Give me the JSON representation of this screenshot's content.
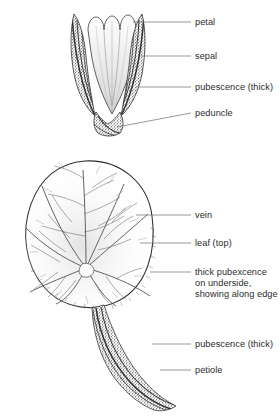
{
  "figure": {
    "background_color": "#ffffff",
    "ink_color": "#231f20",
    "label_color": "#2b2b2b",
    "leader_color": "#6e6e6e"
  },
  "specimens": [
    {
      "name": "flower-bud",
      "parts": [
        "petal",
        "sepal",
        "pubescence",
        "peduncle"
      ]
    },
    {
      "name": "leaf",
      "parts": [
        "vein",
        "blade",
        "pubescence",
        "petiole"
      ]
    }
  ],
  "labels": [
    {
      "id": "petal",
      "text": "petal",
      "x": 195,
      "y": 19
    },
    {
      "id": "sepal",
      "text": "sepal",
      "x": 195,
      "y": 53
    },
    {
      "id": "pubescence-1",
      "text": "pubescence (thick)",
      "x": 195,
      "y": 84
    },
    {
      "id": "peduncle",
      "text": "peduncle",
      "x": 195,
      "y": 110
    },
    {
      "id": "vein",
      "text": "vein",
      "x": 195,
      "y": 212
    },
    {
      "id": "leaf-top",
      "text": "leaf (top)",
      "x": 195,
      "y": 240
    },
    {
      "id": "underside",
      "text": "thick pubexcence\non underside,\nshowing along edge",
      "x": 195,
      "y": 271
    },
    {
      "id": "pubescence-2",
      "text": "pubescence (thick)",
      "x": 195,
      "y": 341
    },
    {
      "id": "petiole",
      "text": "petiole",
      "x": 195,
      "y": 367
    }
  ],
  "caption": {
    "text": "",
    "y": 409
  }
}
